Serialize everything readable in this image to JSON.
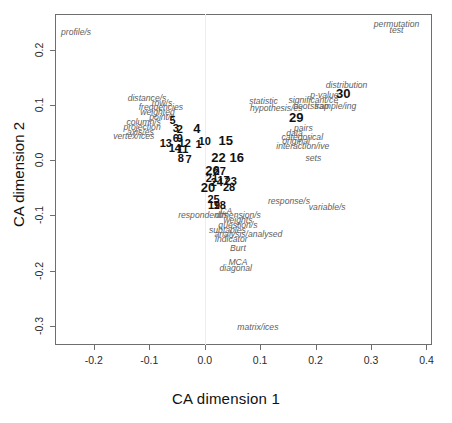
{
  "chart_data": {
    "type": "scatter",
    "title": "",
    "xlabel": "CA dimension 1",
    "ylabel": "CA dimension 2",
    "xlim": [
      -0.27,
      0.41
    ],
    "ylim": [
      -0.335,
      0.265
    ],
    "xticks": [
      "-0.2",
      "-0.1",
      "0.0",
      "0.1",
      "0.2",
      "0.3",
      "0.4"
    ],
    "xtickvals": [
      -0.2,
      -0.1,
      0.0,
      0.1,
      0.2,
      0.3,
      0.4
    ],
    "yticks": [
      "-0.3",
      "-0.2",
      "-0.1",
      "0.0",
      "0.1",
      "0.2"
    ],
    "ytickvals": [
      -0.3,
      -0.2,
      -0.1,
      0.0,
      0.1,
      0.2
    ],
    "grid": false,
    "legend": "none",
    "series": [
      {
        "name": "terms",
        "style": "italic-grey",
        "points": [
          {
            "label": "profile/s",
            "x": -0.232,
            "y": 0.232
          },
          {
            "label": "permutation",
            "x": 0.346,
            "y": 0.247
          },
          {
            "label": "test",
            "x": 0.346,
            "y": 0.236
          },
          {
            "label": "distance/s",
            "x": -0.104,
            "y": 0.112
          },
          {
            "label": "row/s",
            "x": -0.077,
            "y": 0.104
          },
          {
            "label": "frequencies",
            "x": -0.079,
            "y": 0.096
          },
          {
            "label": "weighted",
            "x": -0.085,
            "y": 0.088
          },
          {
            "label": "point/s",
            "x": -0.077,
            "y": 0.079
          },
          {
            "label": "column/s",
            "x": -0.11,
            "y": 0.07
          },
          {
            "label": "projection",
            "x": -0.113,
            "y": 0.061
          },
          {
            "label": "axis/es",
            "x": -0.116,
            "y": 0.052
          },
          {
            "label": "vertex/ices",
            "x": -0.128,
            "y": 0.043
          },
          {
            "label": "statistic",
            "x": 0.106,
            "y": 0.107
          },
          {
            "label": "hypothesis/es",
            "x": 0.129,
            "y": 0.095
          },
          {
            "label": "significant/ce",
            "x": 0.196,
            "y": 0.11
          },
          {
            "label": "p-value",
            "x": 0.216,
            "y": 0.119
          },
          {
            "label": "bootstrap",
            "x": 0.192,
            "y": 0.099
          },
          {
            "label": "sample/ing",
            "x": 0.236,
            "y": 0.099
          },
          {
            "label": "distribution",
            "x": 0.256,
            "y": 0.137
          },
          {
            "label": "pairs",
            "x": 0.178,
            "y": 0.058
          },
          {
            "label": "data",
            "x": 0.162,
            "y": 0.05
          },
          {
            "label": "categorical",
            "x": 0.176,
            "y": 0.042
          },
          {
            "label": "original",
            "x": 0.165,
            "y": 0.034
          },
          {
            "label": "interaction/ive",
            "x": 0.177,
            "y": 0.026
          },
          {
            "label": "sets",
            "x": 0.196,
            "y": 0.004
          },
          {
            "label": "response/s",
            "x": 0.152,
            "y": -0.074
          },
          {
            "label": "variable/s",
            "x": 0.221,
            "y": -0.084
          },
          {
            "label": "respondent/s",
            "x": -0.003,
            "y": -0.1
          },
          {
            "label": "dimension/s",
            "x": 0.06,
            "y": -0.1
          },
          {
            "label": "weights",
            "x": 0.06,
            "y": -0.108
          },
          {
            "label": "question/s",
            "x": 0.06,
            "y": -0.117
          },
          {
            "label": "subtables",
            "x": 0.041,
            "y": -0.126
          },
          {
            "label": "analysis/analysed",
            "x": 0.079,
            "y": -0.134
          },
          {
            "label": "indicator",
            "x": 0.048,
            "y": -0.143
          },
          {
            "label": "Burt",
            "x": 0.06,
            "y": -0.16
          },
          {
            "label": "MCA",
            "x": 0.06,
            "y": -0.184
          },
          {
            "label": "diagonal",
            "x": 0.056,
            "y": -0.196
          },
          {
            "label": "CA",
            "x": 0.039,
            "y": -0.092
          },
          {
            "label": "matrix/ices",
            "x": 0.096,
            "y": -0.303
          }
        ]
      },
      {
        "name": "chapters",
        "style": "bold-black",
        "points": [
          {
            "label": "5",
            "x": -0.058,
            "y": 0.073
          },
          {
            "label": "3",
            "x": -0.052,
            "y": 0.059
          },
          {
            "label": "2",
            "x": -0.045,
            "y": 0.057
          },
          {
            "label": "4",
            "x": -0.014,
            "y": 0.058
          },
          {
            "label": "6",
            "x": -0.052,
            "y": 0.041
          },
          {
            "label": "9",
            "x": -0.045,
            "y": 0.04
          },
          {
            "label": "13",
            "x": -0.07,
            "y": 0.031
          },
          {
            "label": "12",
            "x": -0.036,
            "y": 0.031
          },
          {
            "label": "1",
            "x": -0.011,
            "y": 0.029
          },
          {
            "label": "10",
            "x": 0.0,
            "y": 0.034
          },
          {
            "label": "14",
            "x": -0.054,
            "y": 0.023
          },
          {
            "label": "11",
            "x": -0.04,
            "y": 0.021
          },
          {
            "label": "15",
            "x": 0.038,
            "y": 0.036
          },
          {
            "label": "8",
            "x": -0.043,
            "y": 0.004
          },
          {
            "label": "7",
            "x": -0.029,
            "y": 0.002
          },
          {
            "label": "22",
            "x": 0.025,
            "y": 0.006
          },
          {
            "label": "16",
            "x": 0.058,
            "y": 0.006
          },
          {
            "label": "26",
            "x": 0.014,
            "y": -0.017
          },
          {
            "label": "27",
            "x": 0.027,
            "y": -0.02
          },
          {
            "label": "21",
            "x": 0.013,
            "y": -0.033
          },
          {
            "label": "24",
            "x": 0.022,
            "y": -0.039
          },
          {
            "label": "17",
            "x": 0.034,
            "y": -0.035
          },
          {
            "label": "23",
            "x": 0.047,
            "y": -0.037
          },
          {
            "label": "20",
            "x": 0.006,
            "y": -0.048
          },
          {
            "label": "28",
            "x": 0.044,
            "y": -0.049
          },
          {
            "label": "25",
            "x": 0.016,
            "y": -0.07
          },
          {
            "label": "19",
            "x": 0.017,
            "y": -0.081
          },
          {
            "label": "18",
            "x": 0.027,
            "y": -0.082
          },
          {
            "label": "29",
            "x": 0.165,
            "y": 0.079
          },
          {
            "label": "30",
            "x": 0.25,
            "y": 0.121
          }
        ]
      }
    ]
  },
  "axis": {
    "x_title": "CA dimension 1",
    "y_title": "CA dimension 2"
  }
}
